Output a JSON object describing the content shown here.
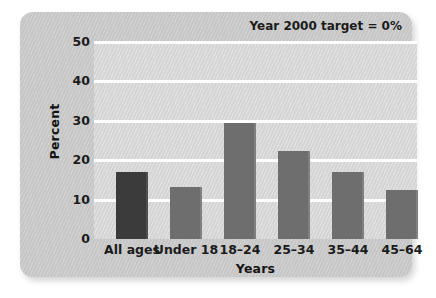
{
  "chart_data": {
    "type": "bar",
    "title": "",
    "subtitle": "",
    "xlabel": "Years",
    "ylabel": "Percent",
    "categories": [
      "All ages",
      "Under 18",
      "18–24",
      "25–34",
      "35–44",
      "45–64"
    ],
    "values": [
      17.0,
      13.3,
      29.5,
      22.3,
      17.0,
      12.5
    ],
    "series": [
      {
        "name": "Percent",
        "values": [
          17.0,
          13.3,
          29.5,
          22.3,
          17.0,
          12.5
        ]
      }
    ],
    "ylim": [
      0,
      50
    ],
    "yticks": [
      0,
      10,
      20,
      30,
      40,
      50
    ],
    "ytick_labels": [
      "0",
      "10",
      "20",
      "30",
      "40",
      "50"
    ],
    "grid": true,
    "grid_axis": "y",
    "legend": false,
    "legend_position": "none",
    "annotations": [
      {
        "name": "target-note",
        "text": "Year 2000 target = 0%",
        "position": "top-right"
      }
    ],
    "bar_colors": [
      "#3b3b3b",
      "#6e6e6e",
      "#6e6e6e",
      "#6e6e6e",
      "#6e6e6e",
      "#6e6e6e"
    ],
    "colors": {
      "bar_highlight": "#3b3b3b",
      "bar_default": "#6e6e6e",
      "plot_background": "#d7d7d7",
      "card_background": "#c9c9c9",
      "gridline": "#fdfdfd",
      "text": "#1b1b1b"
    }
  }
}
